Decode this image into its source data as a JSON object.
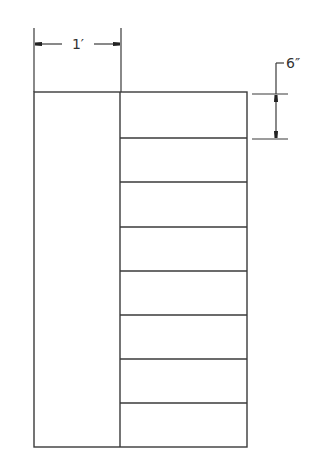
{
  "diagram": {
    "type": "dimensioned-plan-drawing",
    "stroke_color": "#3a3a3a",
    "outer_rect": {
      "x": 34,
      "y": 92,
      "width": 213,
      "height": 355
    },
    "divider_x": 120,
    "right_panel_lines_y": [
      138,
      182,
      227,
      271,
      315,
      359,
      403
    ],
    "right_panel_count": 8,
    "width_dimension": {
      "label": "1′",
      "x1": 34,
      "x2": 121,
      "y": 44,
      "ext_top": 28
    },
    "height_dimension": {
      "label": "6″",
      "x": 276,
      "y1": 94,
      "y2": 139,
      "ext_x1": 252,
      "ext_x2": 288,
      "leader_top": 63,
      "leader_end_x": 284
    }
  }
}
